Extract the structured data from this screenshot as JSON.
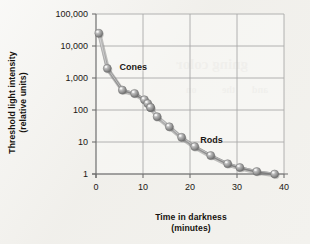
{
  "figure": {
    "title": "",
    "background_color": "#f2f1ed"
  },
  "chart_data": {
    "type": "line",
    "title": "",
    "xlabel": "Time in darkness",
    "xlabel_line2": "(minutes)",
    "ylabel": "Threshold light intensity",
    "ylabel_line2": "(relative units)",
    "xlim": [
      0,
      40
    ],
    "ylim": [
      1,
      100000
    ],
    "yscale": "log",
    "xscale": "linear",
    "grid": true,
    "legend_position": "inline-annotations",
    "xticks": [
      0,
      10,
      20,
      30,
      40
    ],
    "xticklabels": [
      "0",
      "10",
      "20",
      "30",
      "40"
    ],
    "yticks": [
      1,
      10,
      100,
      1000,
      10000,
      100000
    ],
    "yticklabels": [
      "1",
      "10",
      "100",
      "1,000",
      "10,000",
      "100,000"
    ],
    "marker_color": "#8c8c8c",
    "line_color": "#8e8e8e",
    "series": [
      {
        "name": "Cones",
        "annotation": "Cones",
        "x": [
          0.6,
          2.4,
          5.6,
          8.2,
          10.3,
          11.0,
          11.6
        ],
        "y": [
          25000,
          2000,
          420,
          330,
          210,
          160,
          120
        ]
      },
      {
        "name": "Rods",
        "annotation": "Rods",
        "x": [
          11.6,
          13.0,
          15.6,
          18.2,
          21.0,
          24.4,
          28.0,
          30.6,
          34.2,
          38.0
        ],
        "y": [
          120,
          62,
          30,
          14,
          7.2,
          3.8,
          2.1,
          1.6,
          1.2,
          1.0
        ]
      }
    ]
  },
  "annotations": {
    "cones_label": "Cones",
    "rods_label": "Rods"
  },
  "bleed_through": {
    "lines": [
      "gning color",
      "on",
      "the",
      "and"
    ]
  }
}
